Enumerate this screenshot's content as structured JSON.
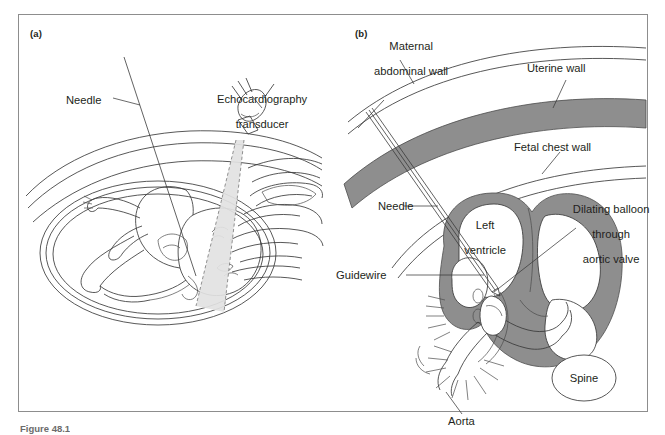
{
  "figure": {
    "caption": "Figure 48.1",
    "panels": [
      {
        "id": "a",
        "letter": "(a)",
        "labels": [
          {
            "name": "needle",
            "text": "Needle"
          },
          {
            "name": "echocardiography-transducer",
            "line1": "Echocardiography",
            "line2": "transducer"
          }
        ]
      },
      {
        "id": "b",
        "letter": "(b)",
        "labels": [
          {
            "name": "maternal-abdominal-wall",
            "line1": "Maternal",
            "line2": "abdominal wall"
          },
          {
            "name": "uterine-wall",
            "text": "Uterine wall"
          },
          {
            "name": "fetal-chest-wall",
            "text": "Fetal chest wall"
          },
          {
            "name": "needle",
            "text": "Needle"
          },
          {
            "name": "left-ventricle",
            "line1": "Left",
            "line2": "ventricle"
          },
          {
            "name": "dilating-balloon",
            "line1": "Dilating balloon",
            "line2": "through",
            "line3": "aortic valve"
          },
          {
            "name": "guidewire",
            "text": "Guidewire"
          },
          {
            "name": "aorta",
            "text": "Aorta"
          },
          {
            "name": "spine",
            "text": "Spine"
          }
        ]
      }
    ]
  },
  "colors": {
    "tissue_gray": "#8e8e8e",
    "line": "#3a3a3a",
    "beam": "#e2e2e2",
    "frame": "#8d8d8d",
    "background": "#ffffff"
  }
}
